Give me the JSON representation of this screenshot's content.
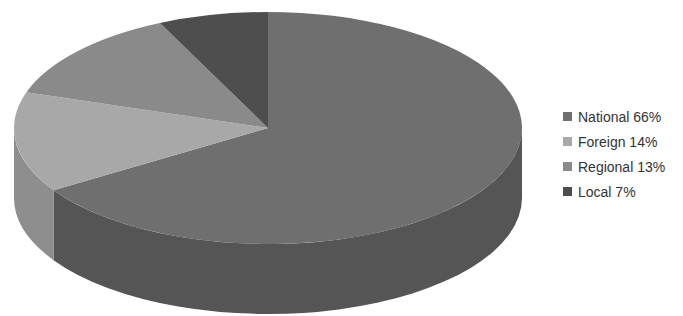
{
  "chart_data": {
    "type": "pie",
    "style": "3d",
    "title": "",
    "categories": [
      "National",
      "Foreign",
      "Regional",
      "Local"
    ],
    "values": [
      66,
      14,
      13,
      7
    ],
    "unit": "%",
    "legend_position": "right",
    "series": [
      {
        "name": "National",
        "value": 66,
        "label": "National 66%",
        "color": "#6f6f6f",
        "side_color": "#555555"
      },
      {
        "name": "Foreign",
        "value": 14,
        "label": "Foreign 14%",
        "color": "#a8a8a8",
        "side_color": "#8e8e8e"
      },
      {
        "name": "Regional",
        "value": 13,
        "label": "Regional 13%",
        "color": "#8a8a8a",
        "side_color": "#707070"
      },
      {
        "name": "Local",
        "value": 7,
        "label": "Local 7%",
        "color": "#4e4e4e",
        "side_color": "#3a3a3a"
      }
    ]
  }
}
